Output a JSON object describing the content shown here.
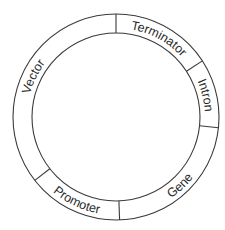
{
  "diagram": {
    "center": [
      116,
      117
    ],
    "outer_radius": 103,
    "inner_radius": 84,
    "stroke_color": "#3a3a3a",
    "background": "#ffffff",
    "dividers_deg": [
      -90,
      -33,
      6,
      88,
      142
    ],
    "segments": [
      {
        "id": "terminator",
        "label": "Terminator",
        "start_deg": -90,
        "end_deg": -33
      },
      {
        "id": "intron",
        "label": "Intron",
        "start_deg": -33,
        "end_deg": 6
      },
      {
        "id": "gene",
        "label": "Gene",
        "start_deg": 6,
        "end_deg": 88
      },
      {
        "id": "promoter",
        "label": "Promoter",
        "start_deg": 88,
        "end_deg": 142
      },
      {
        "id": "vector",
        "label": "Vector",
        "start_deg": 142,
        "end_deg": 270
      }
    ]
  }
}
